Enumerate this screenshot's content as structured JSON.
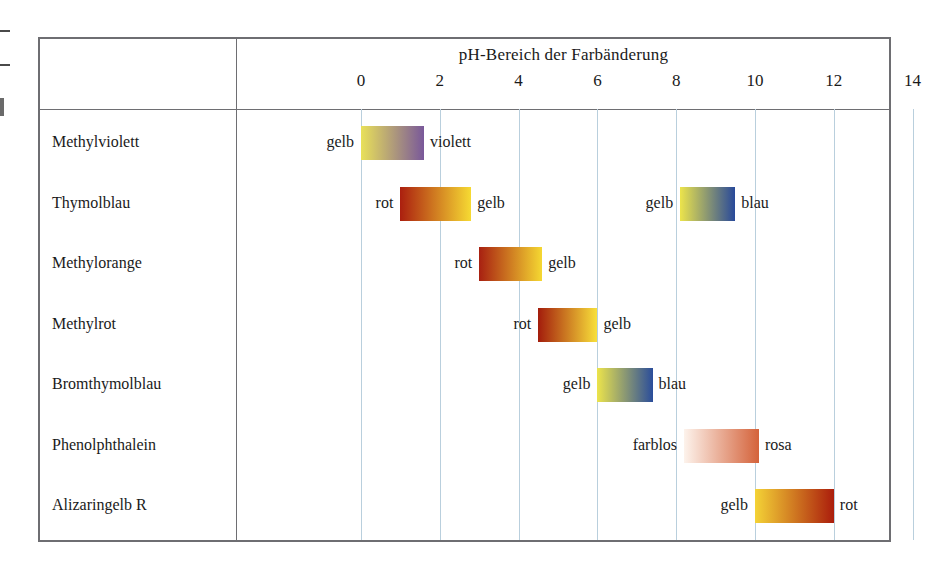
{
  "chart_data": {
    "type": "bar",
    "title": "pH-Bereich der Farbänderung",
    "xlabel": "pH",
    "ylabel": "",
    "xlim": [
      -1,
      15
    ],
    "ticks": [
      0,
      2,
      4,
      6,
      8,
      10,
      12,
      14
    ],
    "grid": true,
    "legend": "none",
    "categories": [
      "Methylviolett",
      "Thymolblau",
      "Methylorange",
      "Methylrot",
      "Bromthymolblau",
      "Phenolphthalein",
      "Alizaringelb R"
    ],
    "ranges": [
      {
        "indicator": "Methylviolett",
        "bands": [
          {
            "ph_start": 0.0,
            "ph_end": 1.6,
            "color_start": "#e9e159",
            "color_end": "#79589a",
            "label_left": "gelb",
            "label_right": "violett"
          }
        ]
      },
      {
        "indicator": "Thymolblau",
        "bands": [
          {
            "ph_start": 1.0,
            "ph_end": 2.8,
            "color_start": "#ab1f0f",
            "color_end": "#f6da33",
            "label_left": "rot",
            "label_right": "gelb"
          },
          {
            "ph_start": 8.1,
            "ph_end": 9.5,
            "color_start": "#ece44b",
            "color_end": "#28499a",
            "label_left": "gelb",
            "label_right": "blau"
          }
        ]
      },
      {
        "indicator": "Methylorange",
        "bands": [
          {
            "ph_start": 3.0,
            "ph_end": 4.6,
            "color_start": "#a82011",
            "color_end": "#f5d832",
            "label_left": "rot",
            "label_right": "gelb"
          }
        ]
      },
      {
        "indicator": "Methylrot",
        "bands": [
          {
            "ph_start": 4.5,
            "ph_end": 6.0,
            "color_start": "#a31c0c",
            "color_end": "#f8e03a",
            "label_left": "rot",
            "label_right": "gelb"
          }
        ]
      },
      {
        "indicator": "Bromthymolblau",
        "bands": [
          {
            "ph_start": 6.0,
            "ph_end": 7.4,
            "color_start": "#ece44b",
            "color_end": "#2a4d9b",
            "label_left": "gelb",
            "label_right": "blau"
          }
        ]
      },
      {
        "indicator": "Phenolphthalein",
        "bands": [
          {
            "ph_start": 8.2,
            "ph_end": 10.1,
            "color_start": "#fdf3ec",
            "color_end": "#d4623a",
            "label_left": "farblos",
            "label_right": "rosa"
          }
        ]
      },
      {
        "indicator": "Alizaringelb R",
        "bands": [
          {
            "ph_start": 10.0,
            "ph_end": 12.0,
            "color_start": "#f4d336",
            "color_end": "#ab1d0c",
            "label_left": "gelb",
            "label_right": "rot"
          }
        ]
      }
    ],
    "colors": {
      "frame": "#6e6e72",
      "gridline": "#b9cfdd",
      "text": "#1a1a1a",
      "background": "#ffffff"
    }
  }
}
